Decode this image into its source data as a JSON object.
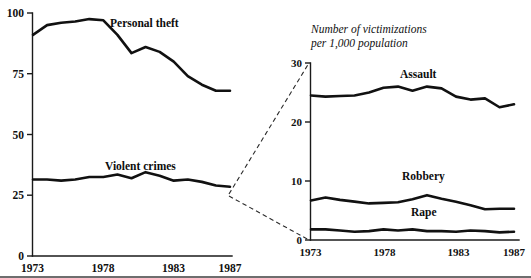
{
  "figure": {
    "background_color": "#ffffff",
    "line_color": "#111111",
    "callout_color": "#2a2a2a"
  },
  "left_panel": {
    "y_ticks": [
      "0",
      "25",
      "50",
      "75",
      "100"
    ],
    "x_ticks": [
      "1973",
      "1978",
      "1983",
      "1987"
    ],
    "series_labels": {
      "personal_theft": "Personal theft",
      "violent_crimes": "Violent crimes"
    }
  },
  "right_panel": {
    "title_line1": "Number of victimizations",
    "title_line2": "per 1,000 population",
    "y_ticks": [
      "0",
      "10",
      "20",
      "30"
    ],
    "x_ticks": [
      "1973",
      "1978",
      "1983",
      "1987"
    ],
    "series_labels": {
      "assault": "Assault",
      "robbery": "Robbery",
      "rape": "Rape"
    }
  },
  "chart_data": [
    {
      "type": "line",
      "panel": "left",
      "title": "",
      "xlabel": "",
      "ylabel": "",
      "xlim": [
        1973,
        1987
      ],
      "ylim": [
        0,
        100
      ],
      "x": [
        1973,
        1974,
        1975,
        1976,
        1977,
        1978,
        1979,
        1980,
        1981,
        1982,
        1983,
        1984,
        1985,
        1986,
        1987
      ],
      "grid": false,
      "legend": "inline-labels",
      "series": [
        {
          "name": "Personal theft",
          "values": [
            91.0,
            95.0,
            96.0,
            96.5,
            97.5,
            97.0,
            91.0,
            83.5,
            86.0,
            84.0,
            80.0,
            74.0,
            70.5,
            68.0,
            68.0
          ]
        },
        {
          "name": "Violent crimes",
          "values": [
            31.5,
            31.5,
            31.0,
            31.5,
            32.5,
            32.5,
            33.5,
            32.0,
            34.5,
            33.0,
            31.0,
            31.5,
            30.5,
            29.0,
            28.5
          ]
        }
      ]
    },
    {
      "type": "line",
      "panel": "right",
      "title": "Number of victimizations per 1,000 population",
      "xlabel": "",
      "ylabel": "Number of victimizations per 1,000 population",
      "xlim": [
        1973,
        1987
      ],
      "ylim": [
        0,
        30
      ],
      "x": [
        1973,
        1974,
        1975,
        1976,
        1977,
        1978,
        1979,
        1980,
        1981,
        1982,
        1983,
        1984,
        1985,
        1986,
        1987
      ],
      "grid": false,
      "legend": "inline-labels",
      "series": [
        {
          "name": "Assault",
          "values": [
            24.5,
            24.3,
            24.4,
            24.5,
            25.0,
            25.8,
            26.0,
            25.3,
            26.0,
            25.7,
            24.3,
            23.8,
            24.0,
            22.5,
            23.0
          ]
        },
        {
          "name": "Robbery",
          "values": [
            6.7,
            7.2,
            6.8,
            6.5,
            6.2,
            6.3,
            6.4,
            6.9,
            7.6,
            7.0,
            6.5,
            5.9,
            5.2,
            5.3,
            5.3
          ]
        },
        {
          "name": "Rape",
          "values": [
            1.8,
            1.8,
            1.6,
            1.4,
            1.5,
            1.8,
            1.6,
            1.8,
            1.5,
            1.5,
            1.4,
            1.6,
            1.5,
            1.3,
            1.4
          ]
        }
      ]
    }
  ]
}
